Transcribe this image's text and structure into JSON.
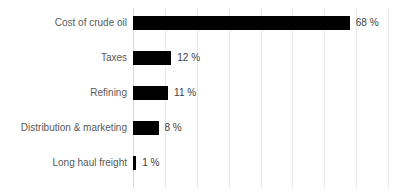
{
  "chart_data": {
    "type": "bar",
    "orientation": "horizontal",
    "title": "",
    "subtitle": "",
    "xlabel": "",
    "ylabel": "",
    "categories": [
      "Cost of crude oil",
      "Taxes",
      "Refining",
      "Distribution & marketing",
      "Long haul freight"
    ],
    "values": [
      68,
      12,
      11,
      8,
      1
    ],
    "data_labels": [
      "68 %",
      "12 %",
      "11 %",
      "8 %",
      "1 %"
    ],
    "unit": "%",
    "xlim": [
      0,
      80
    ],
    "xticks": [
      0,
      10,
      20,
      30,
      40,
      50,
      60,
      70,
      80
    ],
    "xtick_labels": [],
    "grid": true,
    "grid_axis": "x",
    "legend": false,
    "legend_position": "none",
    "bar_color": "#000000",
    "grid_color": "#E8E8E8",
    "axis_color": "#D9D9D9",
    "label_color": "#595959",
    "value_color": "#404040",
    "background": "#FFFFFF"
  },
  "chart": {
    "rows": [
      {
        "label": "Cost of crude oil",
        "value": 68,
        "value_label": "68 %"
      },
      {
        "label": "Taxes",
        "value": 12,
        "value_label": "12 %"
      },
      {
        "label": "Refining",
        "value": 11,
        "value_label": "11 %"
      },
      {
        "label": "Distribution & marketing",
        "value": 8,
        "value_label": "8 %"
      },
      {
        "label": "Long haul freight",
        "value": 1,
        "value_label": "1 %"
      }
    ]
  }
}
